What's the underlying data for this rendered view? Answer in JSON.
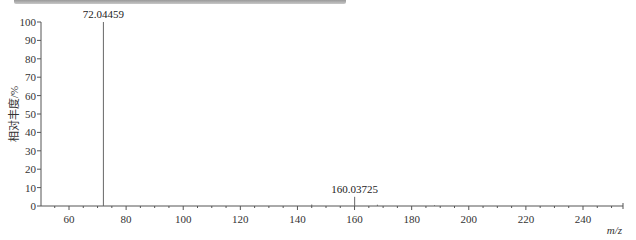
{
  "chart_data": {
    "type": "bar",
    "subtype": "mass-spectrum-stick",
    "title": "",
    "xlabel": "m/z",
    "ylabel": "相对丰度/%",
    "xlim": [
      50,
      254
    ],
    "ylim": [
      0,
      100
    ],
    "x_ticks": [
      60,
      80,
      100,
      120,
      140,
      160,
      180,
      200,
      220,
      240
    ],
    "y_ticks": [
      0,
      10,
      20,
      30,
      40,
      50,
      60,
      70,
      80,
      90,
      100
    ],
    "grid": false,
    "legend": null,
    "peaks": [
      {
        "mz": 72.04459,
        "intensity": 100,
        "label": "72.04459"
      },
      {
        "mz": 160.03725,
        "intensity": 5,
        "label": "160.03725"
      },
      {
        "mz": 145.0,
        "intensity": 0.8,
        "label": ""
      },
      {
        "mz": 168.0,
        "intensity": 0.7,
        "label": ""
      },
      {
        "mz": 188.0,
        "intensity": 0.4,
        "label": ""
      }
    ],
    "annotations": [
      "72.04459",
      "160.03725"
    ]
  },
  "labels": {
    "ylabel": "相对丰度/%",
    "xlabel": "m/z",
    "peak1": "72.04459",
    "peak2": "160.03725"
  }
}
